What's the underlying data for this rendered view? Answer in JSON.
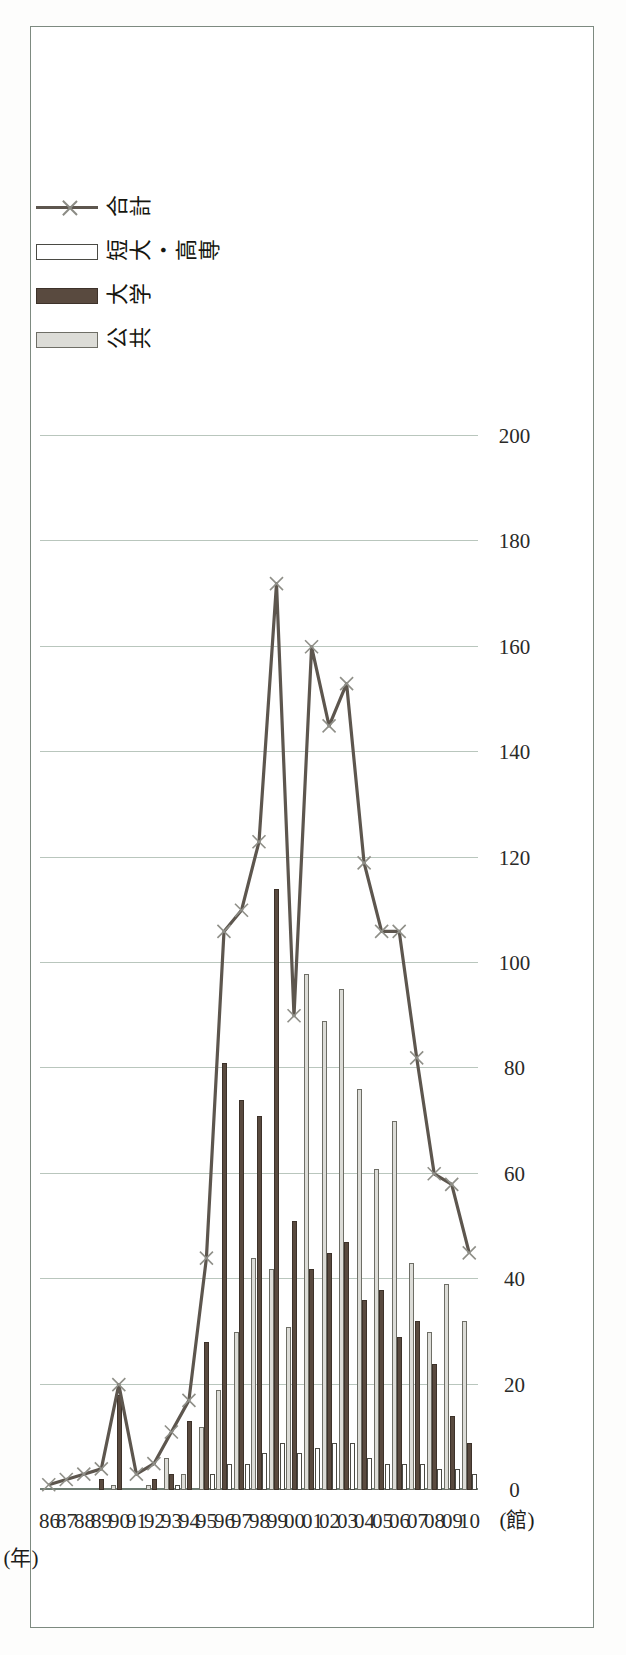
{
  "figure": {
    "unit_label": "(館)",
    "x_axis_name": "(年)",
    "border_color": "#7d8a80",
    "grid_color": "#b9c6bd"
  },
  "legend": {
    "items": [
      {
        "label": "公共",
        "marker": "filled-rect-light-gray",
        "color": "#dcdcd7"
      },
      {
        "label": "大学",
        "marker": "filled-rect-dark-brown",
        "color": "#594a3f"
      },
      {
        "label": "短大・高専",
        "marker": "empty-rect-white",
        "color": "#ffffff"
      },
      {
        "label": "合計",
        "marker": "line-with-x-markers",
        "color": "#5d564e"
      }
    ]
  },
  "chart_data": {
    "type": "bar",
    "orientation": "horizontal-rotated",
    "title": "",
    "xlabel": "(年)",
    "ylabel": "(館)",
    "ylim": [
      0,
      200
    ],
    "ytick_interval": 20,
    "yticks": [
      0,
      20,
      40,
      60,
      80,
      100,
      120,
      140,
      160,
      180,
      200
    ],
    "ytick_labels": [
      "0",
      "20",
      "40",
      "60",
      "80",
      "100",
      "120",
      "140",
      "160",
      "180",
      "200"
    ],
    "grid": true,
    "legend_position": "top-right",
    "categories": [
      "86",
      "87",
      "88",
      "89",
      "90",
      "91",
      "92",
      "93",
      "94",
      "95",
      "96",
      "97",
      "98",
      "99",
      "00",
      "01",
      "02",
      "03",
      "04",
      "05",
      "06",
      "07",
      "08",
      "09",
      "10"
    ],
    "series": [
      {
        "name": "公共",
        "type": "bar",
        "color": "#dcdcd7",
        "values": [
          0,
          0,
          0,
          0,
          1,
          0,
          1,
          6,
          3,
          12,
          19,
          30,
          44,
          42,
          31,
          98,
          89,
          95,
          76,
          61,
          70,
          43,
          30,
          39,
          32
        ]
      },
      {
        "name": "大学",
        "type": "bar",
        "color": "#594a3f",
        "values": [
          0,
          0,
          0,
          2,
          18,
          0,
          2,
          3,
          13,
          28,
          81,
          74,
          71,
          114,
          51,
          42,
          45,
          47,
          36,
          38,
          29,
          32,
          24,
          14,
          9
        ]
      },
      {
        "name": "短大・高専",
        "type": "bar",
        "color": "#ffffff",
        "values": [
          0,
          0,
          0,
          0,
          0,
          0,
          0,
          1,
          0,
          3,
          5,
          5,
          7,
          9,
          7,
          8,
          9,
          9,
          6,
          5,
          5,
          5,
          4,
          4,
          3
        ]
      },
      {
        "name": "合計",
        "type": "line",
        "color": "#5d564e",
        "marker": "x",
        "values": [
          1,
          2,
          3,
          4,
          20,
          3,
          5,
          11,
          17,
          44,
          106,
          110,
          123,
          172,
          90,
          160,
          145,
          153,
          119,
          106,
          106,
          82,
          60,
          58,
          45
        ]
      }
    ]
  }
}
